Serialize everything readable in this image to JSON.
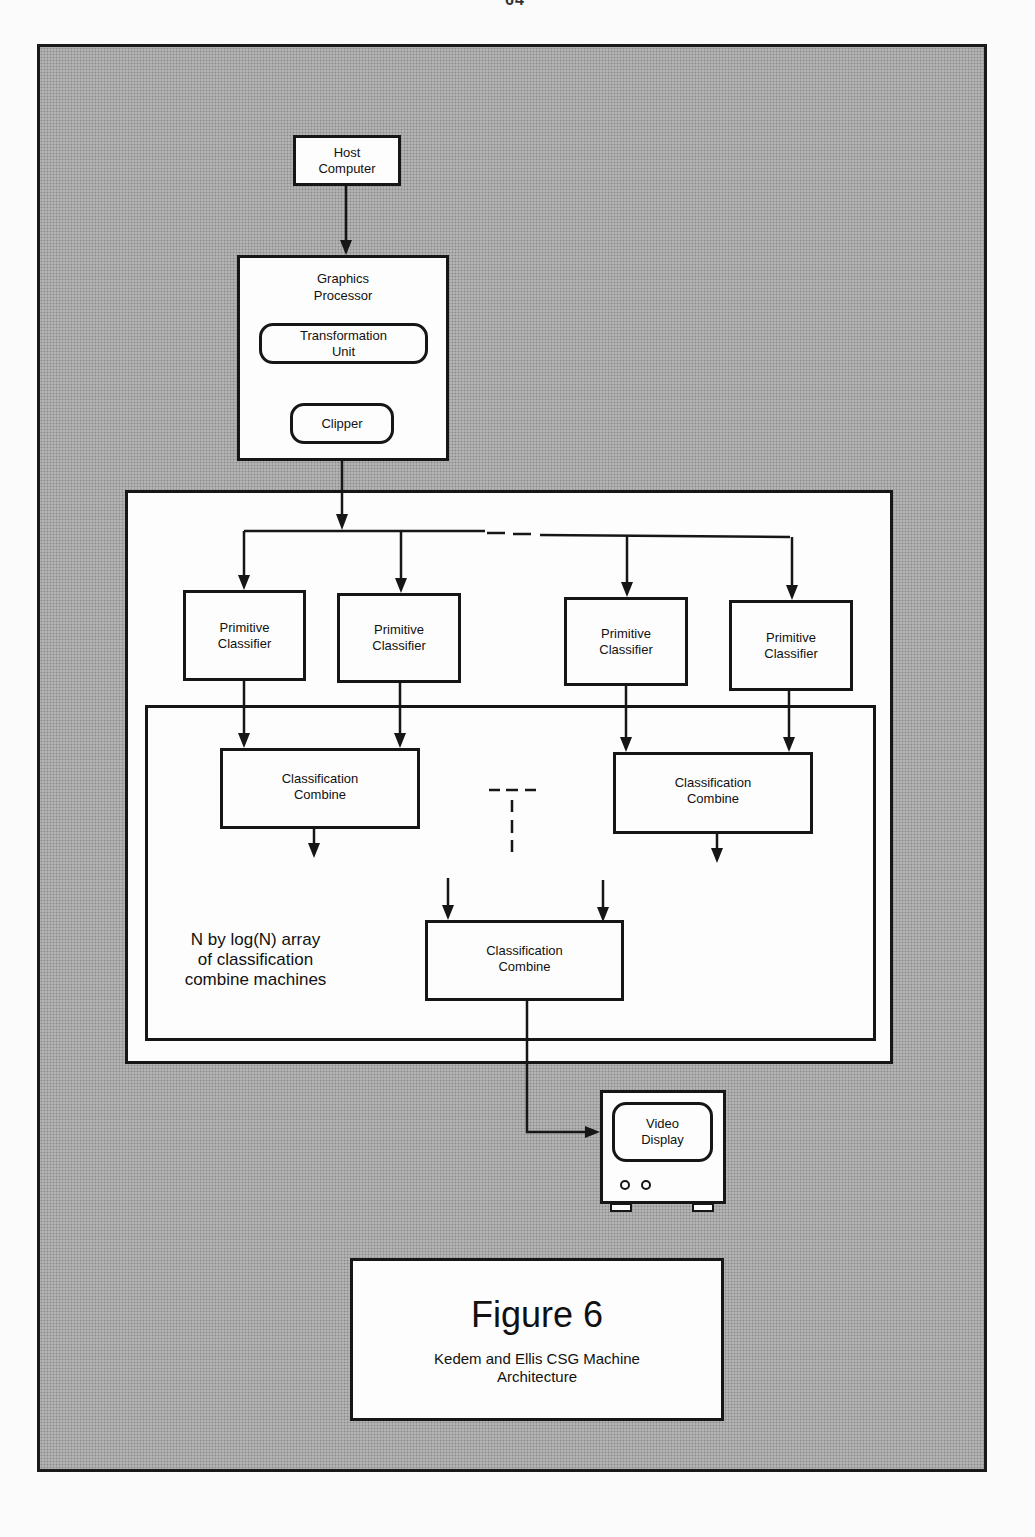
{
  "page": {
    "header_fragment": "64"
  },
  "diagram": {
    "host_computer": {
      "line1": "Host",
      "line2": "Computer"
    },
    "graphics_processor": {
      "title_line1": "Graphics",
      "title_line2": "Processor",
      "transformation_unit": {
        "line1": "Transformation",
        "line2": "Unit"
      },
      "clipper": {
        "label": "Clipper"
      }
    },
    "primitive_classifiers": [
      {
        "line1": "Primitive",
        "line2": "Classifier"
      },
      {
        "line1": "Primitive",
        "line2": "Classifier"
      },
      {
        "line1": "Primitive",
        "line2": "Classifier"
      },
      {
        "line1": "Primitive",
        "line2": "Classifier"
      }
    ],
    "classification_combines": [
      {
        "line1": "Classification",
        "line2": "Combine"
      },
      {
        "line1": "Classification",
        "line2": "Combine"
      },
      {
        "line1": "Classification",
        "line2": "Combine"
      }
    ],
    "array_note": {
      "line1": "N by log(N) array",
      "line2": "of classification",
      "line3": "combine machines"
    },
    "video_display": {
      "line1": "Video",
      "line2": "Display"
    }
  },
  "caption": {
    "title": "Figure 6",
    "subtitle_line1": "Kedem and Ellis CSG Machine",
    "subtitle_line2": "Architecture"
  },
  "colors": {
    "background": "#fbfbfb",
    "panel_gray": "#c9c9c9",
    "box_fill": "#fdfdfd",
    "line": "#161616"
  }
}
